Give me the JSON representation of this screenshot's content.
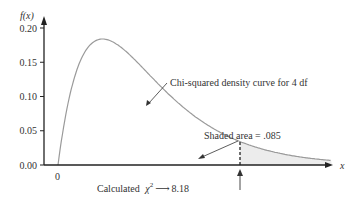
{
  "chart_data": {
    "type": "line",
    "title": "",
    "xlabel": "x",
    "ylabel": "f(x)",
    "yticks": [
      "0.00",
      "0.05",
      "0.10",
      "0.15",
      "0.20"
    ],
    "xticks": [
      "0"
    ],
    "ylim": [
      0,
      0.2
    ],
    "series": [
      {
        "name": "Chi-squared density curve for 4 df",
        "df": 4
      }
    ],
    "annotations": {
      "curve_label": "Chi-squared density curve for 4 df",
      "shaded_label": "Shaded area = .085",
      "calc_prefix": "Calculated",
      "calc_symbol": "χ",
      "calc_sup": "2",
      "calc_value": "8.18"
    },
    "critical_x": 8.18,
    "shaded_area": 0.085
  }
}
